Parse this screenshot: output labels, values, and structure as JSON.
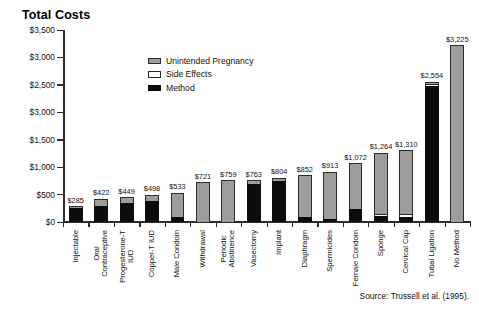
{
  "title": "Total Costs",
  "source_note": "Source: Trussell et al. (1995).",
  "legend": {
    "items": [
      {
        "label": "Unintended Pregnancy",
        "color": "#9d9d9d",
        "key": "unintended_pregnancy"
      },
      {
        "label": "Side Effects",
        "color": "#ffffff",
        "key": "side_effects"
      },
      {
        "label": "Method",
        "color": "#0d0d0d",
        "key": "method"
      }
    ]
  },
  "chart_data": {
    "type": "bar",
    "stacked": true,
    "title": "Total Costs",
    "xlabel": "",
    "ylabel": "",
    "ylim": [
      0,
      3500
    ],
    "grid": false,
    "legend_position": "inside-top-left",
    "ytick_labels": [
      "$3,500",
      "$3,000",
      "$2,500",
      "$3,000",
      "$1,500",
      "$1,000",
      "$500",
      "$0"
    ],
    "ytick_values": [
      3500,
      3000,
      2500,
      2000,
      1500,
      1000,
      500,
      0
    ],
    "categories": [
      "Injectable",
      "Oral Contraceptive",
      "Progesterone-T IUD",
      "Copper-T IUD",
      "Male Condom",
      "Withdrawal",
      "Periodic Abstinence",
      "Vasectomy",
      "Implant",
      "Diaphragm",
      "Spermicides",
      "Female Condom",
      "Sponge",
      "Cervical Cap",
      "Tubal Ligation",
      "No Method"
    ],
    "category_lines": [
      [
        "Injectable"
      ],
      [
        "Oral",
        "Contraceptive"
      ],
      [
        "Progesterone-T",
        "IUD"
      ],
      [
        "Copper-T IUD"
      ],
      [
        "Male Condom"
      ],
      [
        "Withdrawal"
      ],
      [
        "Periodic",
        "Abstinence"
      ],
      [
        "Vasectomy"
      ],
      [
        "Implant"
      ],
      [
        "Diaphragm"
      ],
      [
        "Spermicides"
      ],
      [
        "Female Condom"
      ],
      [
        "Sponge"
      ],
      [
        "Cervical Cap"
      ],
      [
        "Tubal Ligation"
      ],
      [
        "No Method"
      ]
    ],
    "totals": [
      285,
      422,
      449,
      498,
      533,
      721,
      759,
      763,
      804,
      852,
      913,
      1072,
      1264,
      1310,
      2554,
      3225
    ],
    "total_labels": [
      "$285",
      "$422",
      "$449",
      "$498",
      "$533",
      "$721",
      "$759",
      "$763",
      "$804",
      "$852",
      "$913",
      "$1,072",
      "$1,264",
      "$1,310",
      "$2,554",
      "$3,225"
    ],
    "series": [
      {
        "name": "Method",
        "color": "#0d0d0d",
        "values": [
          250,
          300,
          345,
          390,
          95,
          0,
          0,
          700,
          740,
          90,
          60,
          230,
          110,
          95,
          2480,
          0
        ]
      },
      {
        "name": "Side Effects",
        "color": "#ffffff",
        "values": [
          0,
          0,
          0,
          0,
          0,
          0,
          0,
          0,
          0,
          0,
          0,
          0,
          30,
          45,
          40,
          0
        ]
      },
      {
        "name": "Unintended Pregnancy",
        "color": "#9d9d9d",
        "values": [
          35,
          122,
          104,
          108,
          438,
          721,
          759,
          63,
          64,
          762,
          853,
          842,
          1124,
          1170,
          34,
          3225
        ]
      }
    ]
  }
}
